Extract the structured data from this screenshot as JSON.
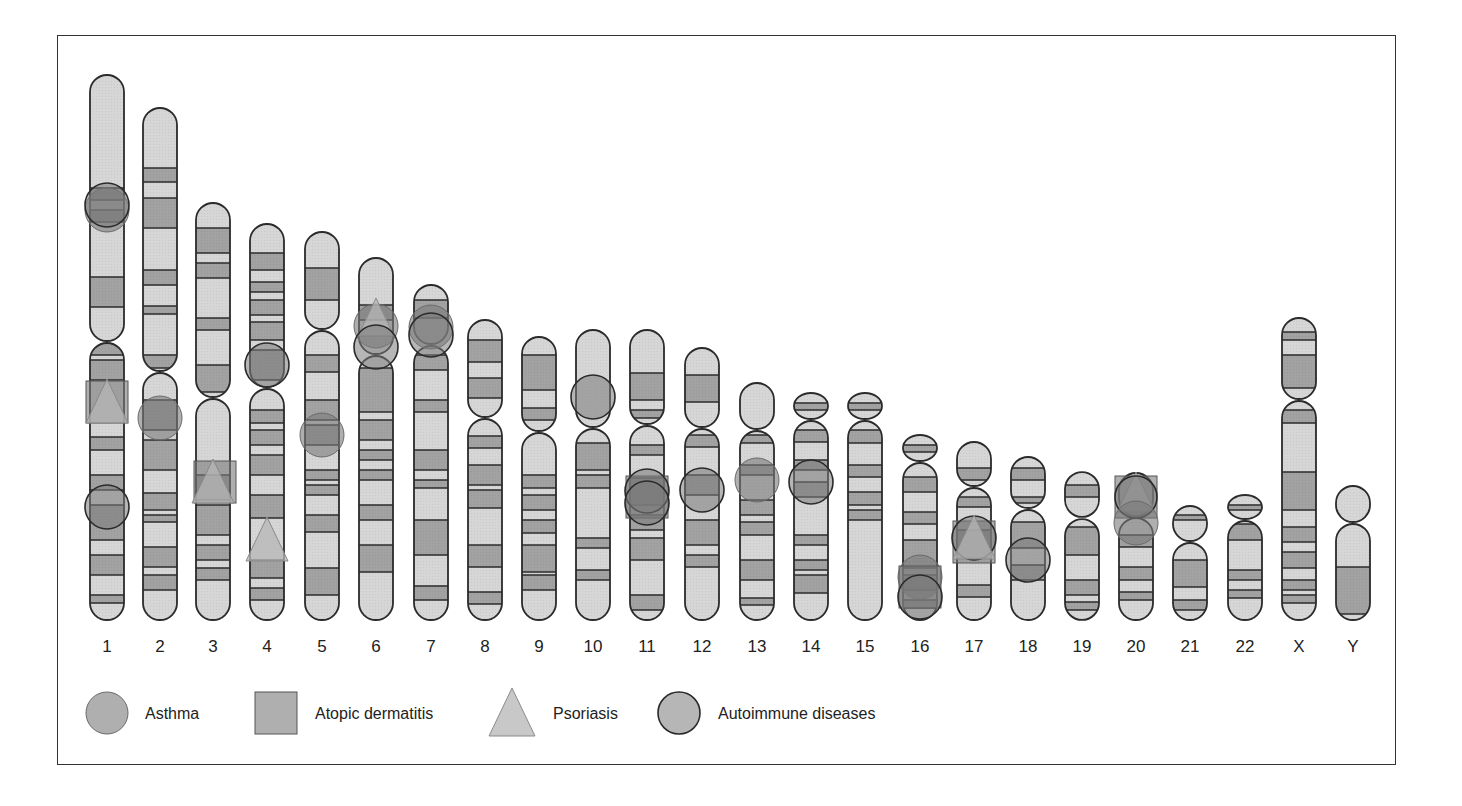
{
  "figure": {
    "type": "chromosome ideogram",
    "colors": {
      "light_band": "#d6d6d6",
      "dark_band": "#a2a2a2",
      "outline": "#2b2b2b",
      "marker_fill": "#7a7a7a",
      "marker_fill_triangle": "#b5b5b5",
      "frame": "#333333"
    }
  },
  "chromosomes": [
    {
      "label": "1",
      "x": 107,
      "top": 75,
      "cen": 342,
      "bottom": 620,
      "dark": [
        [
          188,
          200
        ],
        [
          210,
          222
        ],
        [
          277,
          307
        ],
        [
          341,
          355
        ],
        [
          360,
          380
        ],
        [
          437,
          450
        ],
        [
          475,
          490
        ],
        [
          505,
          540
        ],
        [
          555,
          575
        ],
        [
          595,
          603
        ]
      ]
    },
    {
      "label": "2",
      "x": 160,
      "top": 108,
      "cen": 372,
      "bottom": 620,
      "dark": [
        [
          168,
          182
        ],
        [
          198,
          228
        ],
        [
          270,
          285
        ],
        [
          306,
          314
        ],
        [
          355,
          368
        ],
        [
          400,
          430
        ],
        [
          440,
          470
        ],
        [
          493,
          510
        ],
        [
          515,
          522
        ],
        [
          547,
          567
        ],
        [
          575,
          590
        ]
      ]
    },
    {
      "label": "3",
      "x": 213,
      "top": 203,
      "cen": 398,
      "bottom": 620,
      "dark": [
        [
          228,
          253
        ],
        [
          263,
          278
        ],
        [
          318,
          330
        ],
        [
          365,
          392
        ],
        [
          475,
          500
        ],
        [
          505,
          535
        ],
        [
          545,
          560
        ],
        [
          568,
          580
        ]
      ]
    },
    {
      "label": "4",
      "x": 267,
      "top": 224,
      "cen": 388,
      "bottom": 620,
      "dark": [
        [
          253,
          270
        ],
        [
          282,
          292
        ],
        [
          300,
          315
        ],
        [
          322,
          340
        ],
        [
          350,
          380
        ],
        [
          410,
          423
        ],
        [
          430,
          445
        ],
        [
          455,
          475
        ],
        [
          495,
          518
        ],
        [
          560,
          578
        ],
        [
          588,
          600
        ]
      ]
    },
    {
      "label": "5",
      "x": 322,
      "top": 232,
      "cen": 330,
      "bottom": 620,
      "dark": [
        [
          268,
          300
        ],
        [
          355,
          372
        ],
        [
          400,
          420
        ],
        [
          425,
          445
        ],
        [
          470,
          480
        ],
        [
          485,
          495
        ],
        [
          515,
          532
        ],
        [
          568,
          595
        ]
      ]
    },
    {
      "label": "6",
      "x": 376,
      "top": 258,
      "cen": 355,
      "bottom": 620,
      "dark": [
        [
          305,
          320
        ],
        [
          368,
          412
        ],
        [
          420,
          440
        ],
        [
          450,
          460
        ],
        [
          470,
          480
        ],
        [
          505,
          520
        ],
        [
          545,
          572
        ]
      ]
    },
    {
      "label": "7",
      "x": 431,
      "top": 285,
      "cen": 345,
      "bottom": 620,
      "dark": [
        [
          300,
          318
        ],
        [
          355,
          370
        ],
        [
          400,
          412
        ],
        [
          450,
          470
        ],
        [
          480,
          488
        ],
        [
          520,
          555
        ],
        [
          586,
          600
        ]
      ]
    },
    {
      "label": "8",
      "x": 485,
      "top": 320,
      "cen": 418,
      "bottom": 620,
      "dark": [
        [
          340,
          362
        ],
        [
          378,
          398
        ],
        [
          436,
          448
        ],
        [
          465,
          485
        ],
        [
          490,
          508
        ],
        [
          545,
          567
        ],
        [
          592,
          604
        ]
      ]
    },
    {
      "label": "9",
      "x": 539,
      "top": 337,
      "cen": 432,
      "bottom": 620,
      "dark": [
        [
          355,
          390
        ],
        [
          408,
          420
        ],
        [
          475,
          488
        ],
        [
          495,
          510
        ],
        [
          520,
          533
        ],
        [
          545,
          572
        ],
        [
          575,
          590
        ]
      ]
    },
    {
      "label": "10",
      "x": 593,
      "top": 330,
      "cen": 428,
      "bottom": 620,
      "dark": [
        [
          443,
          470
        ],
        [
          475,
          488
        ],
        [
          538,
          548
        ],
        [
          570,
          580
        ]
      ]
    },
    {
      "label": "11",
      "x": 647,
      "top": 330,
      "cen": 425,
      "bottom": 620,
      "dark": [
        [
          373,
          400
        ],
        [
          410,
          418
        ],
        [
          445,
          455
        ],
        [
          478,
          505
        ],
        [
          515,
          530
        ],
        [
          538,
          560
        ],
        [
          595,
          610
        ]
      ]
    },
    {
      "label": "12",
      "x": 702,
      "top": 348,
      "cen": 428,
      "bottom": 620,
      "dark": [
        [
          375,
          402
        ],
        [
          435,
          447
        ],
        [
          475,
          495
        ],
        [
          520,
          545
        ],
        [
          555,
          567
        ]
      ]
    },
    {
      "label": "13",
      "x": 757,
      "top": 383,
      "cen": 430,
      "bottom": 620,
      "dark": [
        [
          435,
          443
        ],
        [
          465,
          475
        ],
        [
          500,
          515
        ],
        [
          522,
          535
        ],
        [
          560,
          580
        ],
        [
          598,
          605
        ]
      ]
    },
    {
      "label": "14",
      "x": 811,
      "top": 393,
      "cen": 420,
      "bottom": 620,
      "dark": [
        [
          403,
          410
        ],
        [
          430,
          442
        ],
        [
          460,
          470
        ],
        [
          482,
          497
        ],
        [
          535,
          545
        ],
        [
          560,
          570
        ],
        [
          575,
          593
        ]
      ]
    },
    {
      "label": "15",
      "x": 865,
      "top": 393,
      "cen": 420,
      "bottom": 620,
      "dark": [
        [
          403,
          410
        ],
        [
          430,
          443
        ],
        [
          465,
          477
        ],
        [
          492,
          505
        ],
        [
          510,
          520
        ]
      ]
    },
    {
      "label": "16",
      "x": 920,
      "top": 435,
      "cen": 462,
      "bottom": 620,
      "dark": [
        [
          445,
          452
        ],
        [
          477,
          492
        ],
        [
          512,
          524
        ],
        [
          540,
          568
        ],
        [
          575,
          590
        ],
        [
          600,
          608
        ]
      ]
    },
    {
      "label": "17",
      "x": 974,
      "top": 442,
      "cen": 487,
      "bottom": 620,
      "dark": [
        [
          468,
          480
        ],
        [
          497,
          507
        ],
        [
          530,
          558
        ],
        [
          585,
          597
        ]
      ]
    },
    {
      "label": "18",
      "x": 1028,
      "top": 457,
      "cen": 509,
      "bottom": 620,
      "dark": [
        [
          468,
          480
        ],
        [
          497,
          503
        ],
        [
          522,
          548
        ],
        [
          565,
          580
        ]
      ]
    },
    {
      "label": "19",
      "x": 1082,
      "top": 472,
      "cen": 518,
      "bottom": 620,
      "dark": [
        [
          485,
          497
        ],
        [
          527,
          555
        ],
        [
          580,
          595
        ],
        [
          602,
          610
        ]
      ]
    },
    {
      "label": "20",
      "x": 1136,
      "top": 473,
      "cen": 517,
      "bottom": 620,
      "dark": [
        [
          535,
          547
        ],
        [
          567,
          580
        ],
        [
          592,
          600
        ]
      ]
    },
    {
      "label": "21",
      "x": 1190,
      "top": 506,
      "cen": 542,
      "bottom": 620,
      "dark": [
        [
          515,
          520
        ],
        [
          560,
          587
        ],
        [
          600,
          610
        ]
      ]
    },
    {
      "label": "22",
      "x": 1245,
      "top": 495,
      "cen": 520,
      "bottom": 620,
      "dark": [
        [
          505,
          510
        ],
        [
          524,
          540
        ],
        [
          570,
          580
        ],
        [
          590,
          598
        ]
      ]
    },
    {
      "label": "X",
      "x": 1299,
      "top": 318,
      "cen": 400,
      "bottom": 620,
      "dark": [
        [
          332,
          340
        ],
        [
          355,
          388
        ],
        [
          410,
          423
        ],
        [
          472,
          510
        ],
        [
          527,
          542
        ],
        [
          552,
          568
        ],
        [
          580,
          590
        ],
        [
          595,
          603
        ]
      ]
    },
    {
      "label": "Y",
      "x": 1353,
      "top": 486,
      "cen": 523,
      "bottom": 620,
      "dark": [
        [
          567,
          614
        ]
      ]
    }
  ],
  "markers": [
    {
      "type": "asthma",
      "chr": "1",
      "x": 107,
      "y": 210,
      "r": 22
    },
    {
      "type": "autoimmune",
      "chr": "1",
      "x": 107,
      "y": 205,
      "r": 22
    },
    {
      "type": "atopic",
      "chr": "1",
      "x": 107,
      "y": 402,
      "r": 21
    },
    {
      "type": "psoriasis",
      "chr": "1",
      "x": 107,
      "y": 402,
      "r": 21
    },
    {
      "type": "autoimmune",
      "chr": "1",
      "x": 107,
      "y": 507,
      "r": 22
    },
    {
      "type": "asthma",
      "chr": "2",
      "x": 160,
      "y": 418,
      "r": 22
    },
    {
      "type": "atopic",
      "chr": "3",
      "x": 215,
      "y": 482,
      "r": 21
    },
    {
      "type": "psoriasis",
      "chr": "3",
      "x": 213,
      "y": 482,
      "r": 21
    },
    {
      "type": "autoimmune",
      "chr": "4",
      "x": 267,
      "y": 365,
      "r": 22
    },
    {
      "type": "psoriasis",
      "chr": "4",
      "x": 267,
      "y": 540,
      "r": 21
    },
    {
      "type": "asthma",
      "chr": "5",
      "x": 322,
      "y": 435,
      "r": 22
    },
    {
      "type": "asthma",
      "chr": "6",
      "x": 376,
      "y": 326,
      "r": 22
    },
    {
      "type": "psoriasis",
      "chr": "6",
      "x": 376,
      "y": 318,
      "r": 18
    },
    {
      "type": "autoimmune",
      "chr": "6",
      "x": 376,
      "y": 347,
      "r": 22
    },
    {
      "type": "asthma",
      "chr": "7",
      "x": 431,
      "y": 327,
      "r": 22
    },
    {
      "type": "autoimmune",
      "chr": "7",
      "x": 431,
      "y": 335,
      "r": 22
    },
    {
      "type": "autoimmune",
      "chr": "10",
      "x": 593,
      "y": 397,
      "r": 22
    },
    {
      "type": "atopic",
      "chr": "11",
      "x": 647,
      "y": 497,
      "r": 21
    },
    {
      "type": "autoimmune",
      "chr": "11",
      "x": 647,
      "y": 491,
      "r": 22
    },
    {
      "type": "autoimmune",
      "chr": "11",
      "x": 647,
      "y": 503,
      "r": 22
    },
    {
      "type": "autoimmune",
      "chr": "12",
      "x": 702,
      "y": 490,
      "r": 22
    },
    {
      "type": "asthma",
      "chr": "13",
      "x": 757,
      "y": 480,
      "r": 22
    },
    {
      "type": "autoimmune",
      "chr": "14",
      "x": 811,
      "y": 482,
      "r": 22
    },
    {
      "type": "asthma",
      "chr": "16",
      "x": 920,
      "y": 577,
      "r": 22
    },
    {
      "type": "atopic",
      "chr": "16",
      "x": 920,
      "y": 587,
      "r": 21
    },
    {
      "type": "autoimmune",
      "chr": "16",
      "x": 920,
      "y": 597,
      "r": 22
    },
    {
      "type": "atopic",
      "chr": "17",
      "x": 974,
      "y": 542,
      "r": 21
    },
    {
      "type": "autoimmune",
      "chr": "17",
      "x": 974,
      "y": 538,
      "r": 22
    },
    {
      "type": "psoriasis",
      "chr": "17",
      "x": 974,
      "y": 538,
      "r": 21
    },
    {
      "type": "autoimmune",
      "chr": "18",
      "x": 1028,
      "y": 560,
      "r": 22
    },
    {
      "type": "atopic",
      "chr": "20",
      "x": 1136,
      "y": 497,
      "r": 21
    },
    {
      "type": "psoriasis",
      "chr": "20",
      "x": 1136,
      "y": 493,
      "r": 19
    },
    {
      "type": "autoimmune",
      "chr": "20",
      "x": 1136,
      "y": 497,
      "r": 21
    },
    {
      "type": "asthma",
      "chr": "20",
      "x": 1136,
      "y": 523,
      "r": 22
    }
  ],
  "legend": {
    "items": [
      {
        "type": "asthma",
        "label": "Asthma",
        "x": 107,
        "text_x": 145
      },
      {
        "type": "atopic",
        "label": "Atopic dermatitis",
        "x": 276,
        "text_x": 315
      },
      {
        "type": "psoriasis",
        "label": "Psoriasis",
        "x": 512,
        "text_x": 553
      },
      {
        "type": "autoimmune",
        "label": "Autoimmune diseases",
        "x": 679,
        "text_x": 718
      }
    ],
    "y": 713
  }
}
